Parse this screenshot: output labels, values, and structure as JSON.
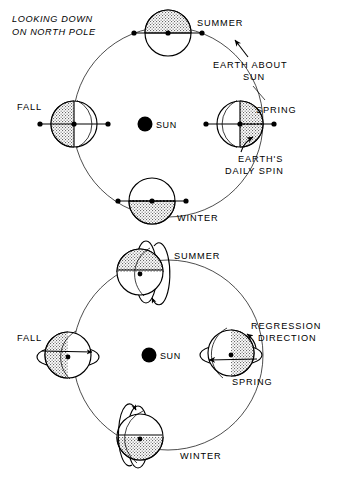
{
  "figure": {
    "title_line1": "LOOKING DOWN",
    "title_line2": "ON NORTH POLE",
    "sun_label_top": "SUN",
    "sun_label_bottom": "SUN"
  },
  "panel_top": {
    "name": "looking-down-on-north-pole",
    "center": {
      "x": 168,
      "y": 122
    },
    "orbit_radius": 95,
    "sun": {
      "x": 145,
      "y": 124,
      "r": 7.5
    },
    "seasons": [
      {
        "key": "summer",
        "label": "SUMMER",
        "label_x": 168,
        "label_y": 24,
        "earth_x": 168,
        "earth_y": 33,
        "earth_r": 23,
        "shaded": "top"
      },
      {
        "key": "fall",
        "label": "FALL",
        "label_x": 18,
        "label_y": 107,
        "earth_x": 74,
        "earth_y": 124,
        "earth_r": 23,
        "shaded": "left"
      },
      {
        "key": "spring",
        "label": "SPRING",
        "label_x": 258,
        "label_y": 110,
        "earth_x": 240,
        "earth_y": 124,
        "earth_r": 23,
        "shaded": "right"
      },
      {
        "key": "winter",
        "label": "WINTER",
        "label_x": 175,
        "label_y": 219,
        "earth_x": 152,
        "earth_y": 201,
        "earth_r": 23,
        "shaded": "bottom"
      }
    ],
    "annotations": [
      {
        "key": "earth-about-sun",
        "line1": "EARTH ABOUT",
        "line2": "SUN",
        "x": 240,
        "y": 62
      },
      {
        "key": "earths-daily-spin",
        "line1": "EARTH'S",
        "line2": "DAILY SPIN",
        "x": 245,
        "y": 153
      }
    ]
  },
  "panel_bottom": {
    "name": "regression-of-nodes",
    "center": {
      "x": 168,
      "y": 355
    },
    "orbit_radius": 95,
    "sun": {
      "x": 149,
      "y": 355,
      "r": 7.5
    },
    "seasons": [
      {
        "key": "summer",
        "label": "SUMMER",
        "label_x": 172,
        "label_y": 256,
        "earth_x": 140,
        "earth_y": 272,
        "earth_r": 23,
        "shaded": "top"
      },
      {
        "key": "fall",
        "label": "FALL",
        "label_x": 18,
        "label_y": 338,
        "earth_x": 68,
        "earth_y": 355,
        "earth_r": 23,
        "shaded": "left"
      },
      {
        "key": "spring",
        "label": "SPRING",
        "label_x": 232,
        "label_y": 382,
        "earth_x": 231,
        "earth_y": 353,
        "earth_r": 23,
        "shaded": "right"
      },
      {
        "key": "winter",
        "label": "WINTER",
        "label_x": 178,
        "label_y": 456,
        "earth_x": 140,
        "earth_y": 437,
        "earth_r": 23,
        "shaded": "bottom"
      }
    ],
    "annotations": [
      {
        "key": "regression-direction",
        "line1": "REGRESSION",
        "line2": "DIRECTION",
        "x": 254,
        "y": 327
      }
    ]
  }
}
